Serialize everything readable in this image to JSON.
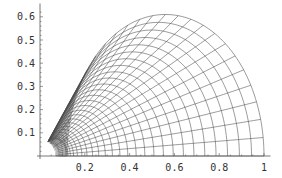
{
  "chart_data": {
    "type": "line",
    "title": "",
    "xlabel": "",
    "ylabel": "",
    "xlim": [
      0,
      1.02
    ],
    "ylim": [
      0,
      0.64
    ],
    "x_ticks": [
      {
        "value": 0.2,
        "label": "0.2"
      },
      {
        "value": 0.4,
        "label": "0.4"
      },
      {
        "value": 0.6,
        "label": "0.6"
      },
      {
        "value": 0.8,
        "label": "0.8"
      },
      {
        "value": 1.0,
        "label": "1"
      }
    ],
    "y_ticks": [
      {
        "value": 0.1,
        "label": "0.1"
      },
      {
        "value": 0.2,
        "label": "0.2"
      },
      {
        "value": 0.3,
        "label": "0.3"
      },
      {
        "value": 0.4,
        "label": "0.4"
      },
      {
        "value": 0.5,
        "label": "0.5"
      },
      {
        "value": 0.6,
        "label": "0.6"
      }
    ],
    "grid": false,
    "legend": null,
    "outer_boundary": {
      "x_intercept": 1.0,
      "peak_x": 0.56,
      "peak_y": 0.61
    },
    "inner_hole_radius": 0.07,
    "concentric_curve_count": 26,
    "radial_curve_count": 24,
    "stroke_color": "#4a4a4a",
    "background_color": "#ffffff"
  },
  "plot_area": {
    "origin_px": [
      40,
      156
    ],
    "x_scale_px_per_unit": 224,
    "y_scale_px_per_unit": 232
  }
}
